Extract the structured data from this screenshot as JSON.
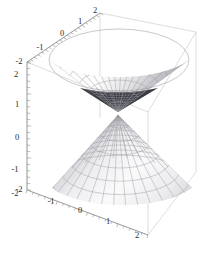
{
  "figure": {
    "kind": "3d-surface-plot",
    "background_color": "#ffffff",
    "box_edge_color": "#c9c9c9",
    "axis_line_color": "#8a8a8a",
    "mesh_line_color": "#9a9aa0",
    "surface_light_color": "#fcfcfc",
    "surface_mid_color": "#d8d8da",
    "surface_dark_color": "#9e9ea4",
    "interior_shadow_color": "#3a3a42"
  },
  "chart_data": {
    "type": "surface",
    "title": "",
    "xlabel": "",
    "ylabel": "",
    "zlabel": "",
    "grid": true,
    "legend": "none",
    "surface_equation": "z^2 = x^2 + y^2",
    "surface_name": "double cone",
    "nappes": 2,
    "apex": [
      0,
      0,
      0
    ],
    "xlim": [
      -2,
      2
    ],
    "ylim": [
      -2,
      2
    ],
    "zlim": [
      -2,
      2
    ],
    "axes": [
      {
        "name": "x-axis",
        "position": "top-left-edge",
        "range": [
          -2,
          2
        ],
        "ticks": [
          -2,
          -1,
          0,
          1,
          2
        ],
        "tick_labels": [
          "-2",
          "-1",
          "0",
          "1",
          "2"
        ],
        "minor_ticks_per_interval": 4
      },
      {
        "name": "z-axis",
        "position": "left-vertical-edge",
        "range": [
          -2,
          2
        ],
        "ticks": [
          2,
          1,
          0,
          -1,
          -2
        ],
        "tick_labels": [
          "2",
          "1",
          "0",
          "-1",
          "-2"
        ],
        "minor_ticks_per_interval": 4
      },
      {
        "name": "y-axis",
        "position": "bottom-front-edge",
        "range": [
          -2,
          2
        ],
        "ticks": [
          -2,
          -1,
          0,
          1,
          2
        ],
        "tick_labels": [
          "-2",
          "-1",
          "0",
          "1",
          "2"
        ],
        "minor_ticks_per_interval": 4
      }
    ],
    "x_tick_labels": [
      {
        "text": "-2",
        "x": 19,
        "y": 64
      },
      {
        "text": "-1",
        "x": 40,
        "y": 50
      },
      {
        "text": "0",
        "x": 62,
        "y": 36
      },
      {
        "text": "1",
        "x": 80,
        "y": 24
      },
      {
        "text": "2",
        "x": 95,
        "y": 13
      }
    ],
    "z_tick_labels": [
      {
        "text": "2",
        "x": 16,
        "y": 77
      },
      {
        "text": "1",
        "x": 17,
        "y": 107
      },
      {
        "text": "0",
        "x": 17,
        "y": 140
      },
      {
        "text": "-1",
        "x": 15,
        "y": 172
      },
      {
        "text": "-2",
        "x": 15,
        "y": 196
      }
    ],
    "y_tick_labels": [
      {
        "text": "-2",
        "x": 19,
        "y": 192
      },
      {
        "text": "-1",
        "x": 51,
        "y": 204
      },
      {
        "text": "0",
        "x": 80,
        "y": 213
      },
      {
        "text": "1",
        "x": 108,
        "y": 224
      },
      {
        "text": "2",
        "x": 137,
        "y": 238
      }
    ],
    "mesh": {
      "radial_lines": 24,
      "circular_lines_per_nappe": 8,
      "upper_nappe_view": "interior",
      "lower_nappe_view": "exterior"
    }
  }
}
